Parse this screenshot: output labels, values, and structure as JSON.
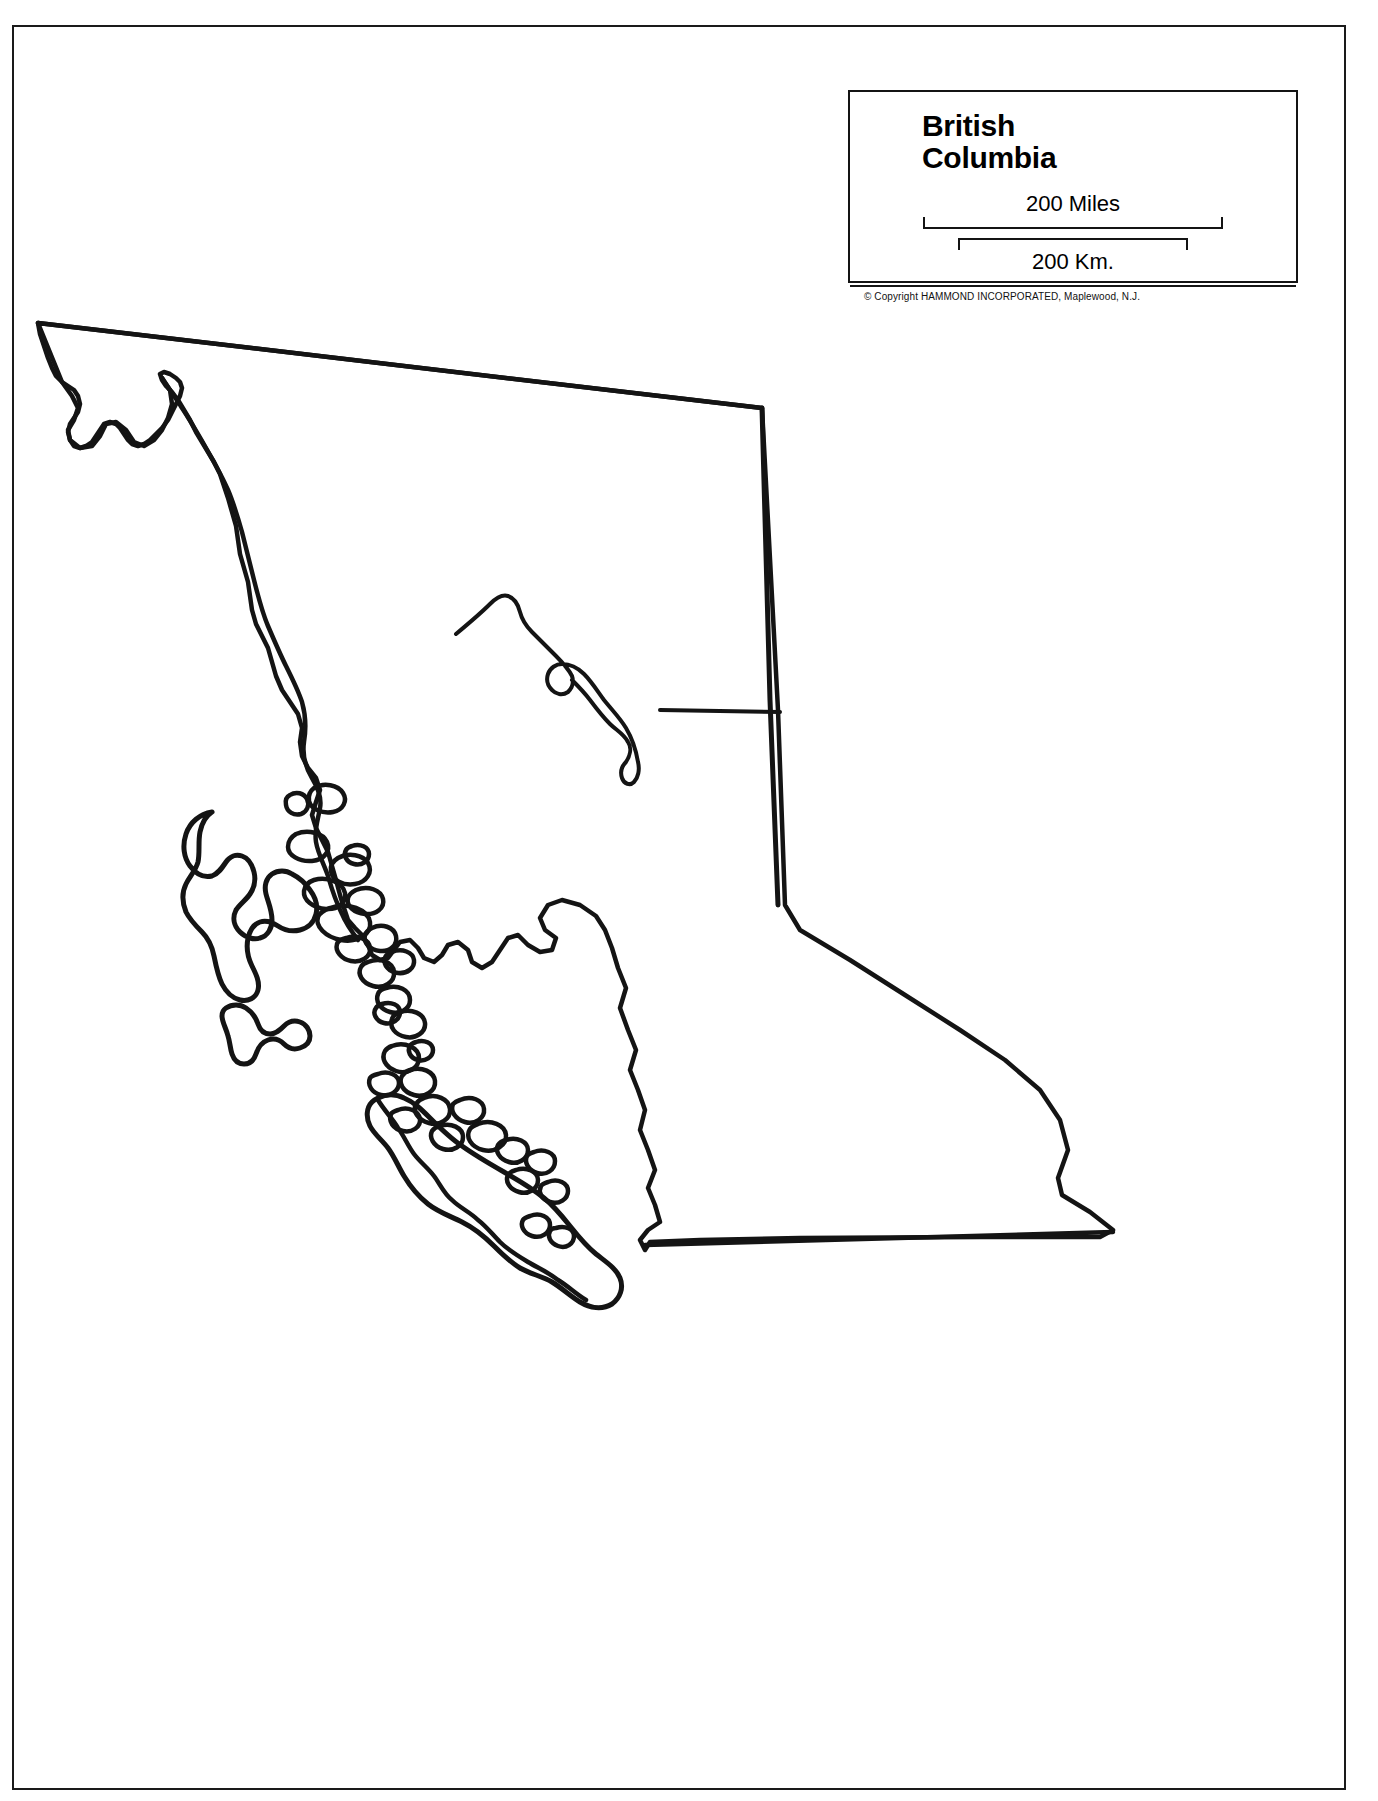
{
  "document": {
    "kind": "printed-outline-map",
    "page_background": "#ffffff",
    "ink_color": "#141414"
  },
  "legend": {
    "title_lines": [
      "British",
      "Columbia"
    ],
    "title_full": "British Columbia",
    "scale_miles": {
      "label": "200 Miles",
      "value": 200,
      "unit": "Miles",
      "bracket": "below"
    },
    "scale_km": {
      "label": "200 Km.",
      "value": 200,
      "unit": "Km.",
      "bracket": "above"
    },
    "copyright": "© Copyright HAMMOND INCORPORATED, Maplewood, N.J."
  },
  "map": {
    "region_name": "British Columbia",
    "features": [
      "mainland-outline",
      "queen-charlotte-islands",
      "vancouver-island",
      "coastal-archipelago",
      "williston-lake",
      "rocky-mountain-trench-line"
    ],
    "stroke_color": "#141414",
    "fill_color": "#ffffff"
  }
}
